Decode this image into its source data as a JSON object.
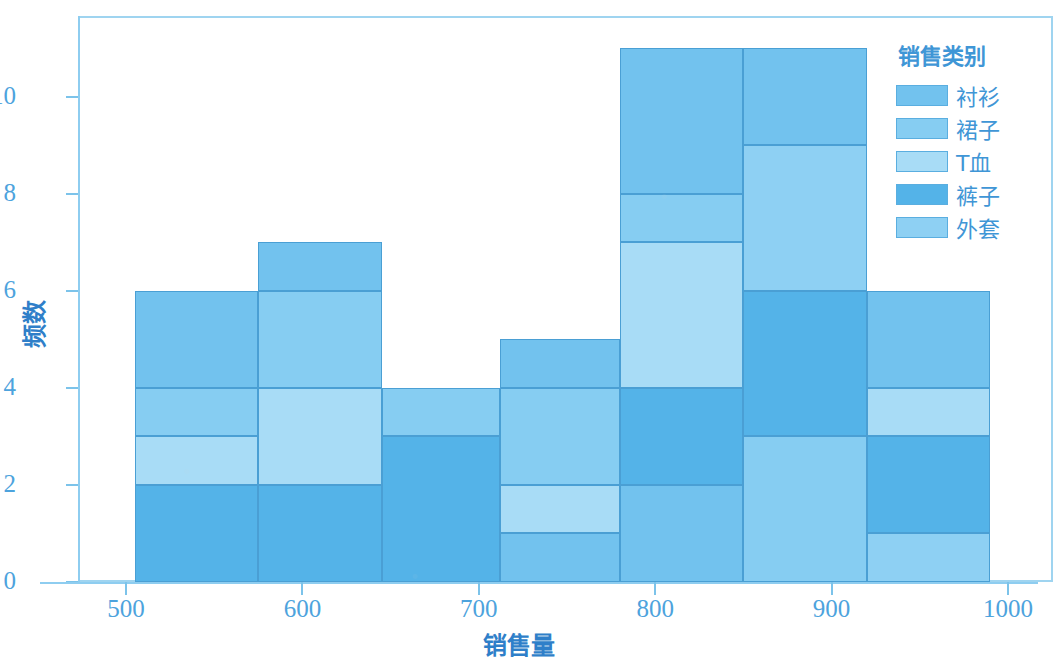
{
  "chart_data": {
    "type": "bar",
    "title": "",
    "xlabel": "销售量",
    "ylabel": "频数",
    "xlim": [
      480,
      1010
    ],
    "ylim": [
      0,
      11.6
    ],
    "xticks": [
      "500",
      "600",
      "700",
      "800",
      "900",
      "1000"
    ],
    "xtick_values": [
      500,
      600,
      700,
      800,
      900,
      1000
    ],
    "yticks": [
      "0",
      "2",
      "4",
      "6",
      "8",
      "10"
    ],
    "ytick_values": [
      0,
      2,
      4,
      6,
      8,
      10
    ],
    "grid": false,
    "stacked": true,
    "legend": {
      "title": "销售类别",
      "position": "right",
      "entries": [
        {
          "label": "衬衫",
          "color": "#72c2ee"
        },
        {
          "label": "裙子",
          "color": "#86cdf2"
        },
        {
          "label": "T血",
          "color": "#a8dcf6"
        },
        {
          "label": "裤子",
          "color": "#54b3e8"
        },
        {
          "label": "外套",
          "color": "#8ed0f3"
        }
      ]
    },
    "bin_edges": [
      505,
      575,
      645,
      712,
      780,
      850,
      920,
      990
    ],
    "series": [
      {
        "name": "衬衫",
        "color": "#72c2ee",
        "values": [
          2,
          1,
          0,
          1,
          3,
          2,
          2
        ]
      },
      {
        "name": "裙子",
        "color": "#86cdf2",
        "values": [
          1,
          2,
          0,
          0,
          1,
          0,
          1
        ]
      },
      {
        "name": "T血",
        "color": "#a8dcf6",
        "values": [
          1,
          2,
          1,
          2,
          3,
          3,
          0
        ]
      },
      {
        "name": "裤子",
        "color": "#54b3e8",
        "values": [
          2,
          2,
          3,
          1,
          2,
          3,
          2
        ]
      },
      {
        "name": "外套",
        "color": "#8ed0f3",
        "values": [
          0,
          0,
          0,
          1,
          2,
          3,
          1
        ]
      }
    ],
    "bar_totals": [
      6,
      7,
      4,
      5,
      11,
      11,
      6
    ],
    "bars": [
      {
        "bin": "505-575",
        "total": 6,
        "segments": [
          {
            "name": "外套",
            "value": 2,
            "from": 0,
            "to": 2,
            "color": "#54b3e8"
          },
          {
            "name": "T血",
            "value": 1,
            "from": 2,
            "to": 3,
            "color": "#a8dcf6"
          },
          {
            "name": "裙子",
            "value": 1,
            "from": 3,
            "to": 4,
            "color": "#86cdf2"
          },
          {
            "name": "衬衫",
            "value": 2,
            "from": 4,
            "to": 6,
            "color": "#72c2ee"
          }
        ]
      },
      {
        "bin": "575-645",
        "total": 7,
        "segments": [
          {
            "name": "外套",
            "value": 2,
            "from": 0,
            "to": 2,
            "color": "#54b3e8"
          },
          {
            "name": "T血",
            "value": 2,
            "from": 2,
            "to": 4,
            "color": "#a8dcf6"
          },
          {
            "name": "裙子",
            "value": 2,
            "from": 4,
            "to": 6,
            "color": "#86cdf2"
          },
          {
            "name": "衬衫",
            "value": 1,
            "from": 6,
            "to": 7,
            "color": "#72c2ee"
          }
        ]
      },
      {
        "bin": "645-712",
        "total": 4,
        "segments": [
          {
            "name": "外套",
            "value": 3,
            "from": 0,
            "to": 3,
            "color": "#54b3e8"
          },
          {
            "name": "T血",
            "value": 1,
            "from": 3,
            "to": 4,
            "color": "#86cdf2"
          }
        ]
      },
      {
        "bin": "712-780",
        "total": 5,
        "segments": [
          {
            "name": "外套",
            "value": 1,
            "from": 0,
            "to": 1,
            "color": "#72c2ee"
          },
          {
            "name": "裤子",
            "value": 1,
            "from": 1,
            "to": 2,
            "color": "#a8dcf6"
          },
          {
            "name": "T血",
            "value": 2,
            "from": 2,
            "to": 4,
            "color": "#86cdf2"
          },
          {
            "name": "衬衫",
            "value": 1,
            "from": 4,
            "to": 5,
            "color": "#72c2ee"
          }
        ]
      },
      {
        "bin": "780-850",
        "total": 11,
        "segments": [
          {
            "name": "外套",
            "value": 2,
            "from": 0,
            "to": 2,
            "color": "#72c2ee"
          },
          {
            "name": "裤子",
            "value": 2,
            "from": 2,
            "to": 4,
            "color": "#54b3e8"
          },
          {
            "name": "T血",
            "value": 3,
            "from": 4,
            "to": 7,
            "color": "#a8dcf6"
          },
          {
            "name": "裙子",
            "value": 1,
            "from": 7,
            "to": 8,
            "color": "#86cdf2"
          },
          {
            "name": "衬衫",
            "value": 3,
            "from": 8,
            "to": 11,
            "color": "#72c2ee"
          }
        ]
      },
      {
        "bin": "850-920",
        "total": 11,
        "segments": [
          {
            "name": "外套",
            "value": 3,
            "from": 0,
            "to": 3,
            "color": "#86cdf2"
          },
          {
            "name": "裤子",
            "value": 3,
            "from": 3,
            "to": 6,
            "color": "#54b3e8"
          },
          {
            "name": "T血",
            "value": 3,
            "from": 6,
            "to": 9,
            "color": "#8ed0f3"
          },
          {
            "name": "衬衫",
            "value": 2,
            "from": 9,
            "to": 11,
            "color": "#72c2ee"
          }
        ]
      },
      {
        "bin": "920-990",
        "total": 6,
        "segments": [
          {
            "name": "外套",
            "value": 1,
            "from": 0,
            "to": 1,
            "color": "#8ed0f3"
          },
          {
            "name": "裤子",
            "value": 2,
            "from": 1,
            "to": 3,
            "color": "#54b3e8"
          },
          {
            "name": "T血",
            "value": 1,
            "from": 3,
            "to": 4,
            "color": "#a8dcf6"
          },
          {
            "name": "衬衫",
            "value": 2,
            "from": 4,
            "to": 6,
            "color": "#72c2ee"
          }
        ]
      }
    ]
  }
}
